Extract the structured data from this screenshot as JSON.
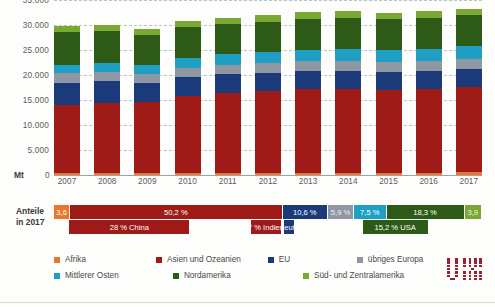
{
  "chart_data": {
    "type": "bar",
    "stacked": true,
    "title": "",
    "xlabel": "",
    "ylabel": "Mt",
    "ylim": [
      0,
      35000
    ],
    "yticks": [
      "0",
      "5.000",
      "10.000",
      "15.000",
      "20.000",
      "25.000",
      "30.000",
      "35.000"
    ],
    "grid": true,
    "legend_position": "bottom",
    "categories": [
      "2007",
      "2008",
      "2009",
      "2010",
      "2011",
      "2012",
      "2013",
      "2014",
      "2015",
      "2016",
      "2017"
    ],
    "series": [
      {
        "name": "Afrika",
        "color": "#e8762c",
        "values": [
          380,
          390,
          400,
          420,
          430,
          450,
          460,
          470,
          480,
          500,
          520
        ]
      },
      {
        "name": "Asien und Ozeanien",
        "color": "#9e1b18",
        "values": [
          13700,
          14100,
          14300,
          15300,
          15900,
          16300,
          16700,
          16800,
          16600,
          16700,
          17100
        ]
      },
      {
        "name": "EU",
        "color": "#1a3a7a",
        "values": [
          4400,
          4300,
          3800,
          3900,
          3800,
          3700,
          3600,
          3500,
          3500,
          3550,
          3600
        ]
      },
      {
        "name": "übriges Europa",
        "color": "#8f97a3",
        "values": [
          1900,
          1900,
          1750,
          1850,
          1900,
          1900,
          1950,
          1950,
          1950,
          2000,
          2000
        ]
      },
      {
        "name": "Mittlerer Osten",
        "color": "#1f9fc4",
        "values": [
          1700,
          1800,
          1850,
          1950,
          2100,
          2250,
          2350,
          2450,
          2500,
          2520,
          2550
        ]
      },
      {
        "name": "Nordamerika",
        "color": "#2d5a16",
        "values": [
          6600,
          6400,
          6000,
          6200,
          6100,
          6100,
          6200,
          6250,
          6150,
          6150,
          6200
        ]
      },
      {
        "name": "Süd- und Zentralamerika",
        "color": "#7aa832",
        "values": [
          1050,
          1100,
          1050,
          1150,
          1200,
          1250,
          1300,
          1320,
          1300,
          1320,
          1330
        ]
      }
    ],
    "totals": [
      29730,
      30090,
      29150,
      30770,
      31430,
      31950,
      32560,
      32740,
      32480,
      32740,
      33300
    ]
  },
  "shares": {
    "title_line1": "Anteile",
    "title_line2": "in 2017",
    "row1": [
      {
        "label": "3,6",
        "pct": 3.6,
        "color": "#e8762c"
      },
      {
        "label": "50,2 %",
        "pct": 50.2,
        "color": "#9e1b18"
      },
      {
        "label": "10,6 %",
        "pct": 10.6,
        "color": "#1a3a7a"
      },
      {
        "label": "5,9 %",
        "pct": 5.9,
        "color": "#8f97a3"
      },
      {
        "label": "7,5 %",
        "pct": 7.5,
        "color": "#1f9fc4"
      },
      {
        "label": "18,3 %",
        "pct": 18.3,
        "color": "#2d5a16"
      },
      {
        "label": "3,9",
        "pct": 3.9,
        "color": "#7aa832"
      }
    ],
    "row2": [
      {
        "label": "28 % China",
        "pct": 28,
        "start": 3.6,
        "color": "#9e1b18"
      },
      {
        "label": "7 % Indien",
        "pct": 7,
        "start": 46.0,
        "color": "#9e1b18"
      },
      {
        "label": "2,3 % Deutschland",
        "pct": 2.3,
        "start": 53.8,
        "color": "#1a3a7a"
      },
      {
        "label": "15,2 % USA",
        "pct": 15.2,
        "start": 72.1,
        "color": "#2d5a16"
      }
    ]
  },
  "legend": {
    "row1": [
      {
        "label": "Afrika",
        "color": "#e8762c"
      },
      {
        "label": "Asien und Ozeanien",
        "color": "#9e1b18"
      },
      {
        "label": "EU",
        "color": "#1a3a7a"
      },
      {
        "label": "übriges Europa",
        "color": "#8f97a3"
      }
    ],
    "row2": [
      {
        "label": "Mittlerer Osten",
        "color": "#1f9fc4"
      },
      {
        "label": "Nordamerika",
        "color": "#2d5a16"
      },
      {
        "label": "Süd- und Zentralamerika",
        "color": "#7aa832"
      }
    ]
  },
  "logo": {
    "name": "wv-stahl-logo",
    "color": "#9c1f2e"
  }
}
